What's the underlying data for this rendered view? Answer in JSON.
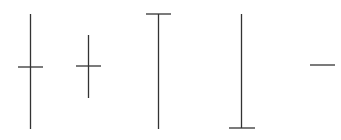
{
  "diagram": {
    "type": "candlestick-doji-patterns",
    "stroke_color": "#333333",
    "background": "#ffffff",
    "shapes": [
      {
        "name": "long-legged-doji",
        "wick": {
          "x": 30.5,
          "y1": 14,
          "y2": 129
        },
        "body": {
          "y": 67,
          "x1": 18,
          "x2": 43
        }
      },
      {
        "name": "doji",
        "wick": {
          "x": 88.5,
          "y1": 35,
          "y2": 98
        },
        "body": {
          "y": 66,
          "x1": 76,
          "x2": 101
        }
      },
      {
        "name": "gravestone-doji",
        "wick": {
          "x": 158.5,
          "y1": 14,
          "y2": 129
        },
        "body": {
          "y": 14,
          "x1": 146,
          "x2": 171
        }
      },
      {
        "name": "dragonfly-doji",
        "wick": {
          "x": 241.5,
          "y1": 14,
          "y2": 128
        },
        "body": {
          "y": 128,
          "x1": 229,
          "x2": 255
        }
      },
      {
        "name": "four-price-doji",
        "wick": null,
        "body": {
          "y": 65,
          "x1": 310,
          "x2": 335
        }
      }
    ]
  }
}
